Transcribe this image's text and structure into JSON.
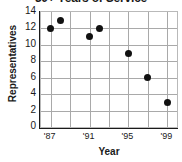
{
  "chart_data": {
    "type": "scatter",
    "title": "30+ Years of Service",
    "xlabel": "Year",
    "ylabel": "Representatives",
    "x": [
      1987,
      1988,
      1991,
      1992,
      1995,
      1997,
      1999
    ],
    "values": [
      12,
      13,
      11,
      12,
      9,
      6,
      3
    ],
    "points": [
      {
        "x": 1987,
        "y": 12
      },
      {
        "x": 1988,
        "y": 13
      },
      {
        "x": 1991,
        "y": 11
      },
      {
        "x": 1992,
        "y": 12
      },
      {
        "x": 1995,
        "y": 9
      },
      {
        "x": 1997,
        "y": 6
      },
      {
        "x": 1999,
        "y": 3
      }
    ],
    "xlim": [
      1986,
      2000
    ],
    "ylim": [
      0,
      14
    ],
    "ytick_labels": [
      "14",
      "12",
      "10",
      "8",
      "6",
      "4",
      "2",
      "0"
    ],
    "ytick_values": [
      14,
      12,
      10,
      8,
      6,
      4,
      2,
      0
    ],
    "xtick_labels": [
      "'87",
      "'91",
      "'95",
      "'99"
    ],
    "xtick_values": [
      1987,
      1991,
      1995,
      1999
    ],
    "grid": true,
    "legend": false,
    "marker_color": "#111111",
    "grid_color": "#a9a9a9",
    "axis_color": "#1a1a1a",
    "background": "#ffffff"
  }
}
